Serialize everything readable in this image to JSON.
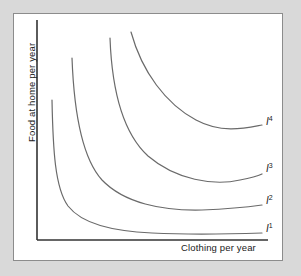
{
  "figure": {
    "background_color": "#d9d9d9",
    "panel_color": "#ffffff",
    "panel_border_color": "#8c8c8c",
    "axis_color": "#333333",
    "curve_color": "#6a6a6a"
  },
  "chart_data": {
    "type": "line",
    "title": "",
    "subtitle": "",
    "xlabel": "Clothing per year",
    "ylabel": "Food at home per year",
    "grid": false,
    "legend_position": "inline-right-endpoint",
    "xlim": [
      0,
      1
    ],
    "ylim": [
      0,
      1
    ],
    "axis_ticks": {
      "x": [],
      "y": []
    },
    "annotations": [
      {
        "text": "I",
        "superscript": "1",
        "at_curve": "I1"
      },
      {
        "text": "I",
        "superscript": "2",
        "at_curve": "I2"
      },
      {
        "text": "I",
        "superscript": "3",
        "at_curve": "I3"
      },
      {
        "text": "I",
        "superscript": "4",
        "at_curve": "I4"
      }
    ],
    "series": [
      {
        "name": "I1",
        "label": "I",
        "superscript": "1",
        "utility_level": 1,
        "label_x": 266,
        "label_y": 223,
        "path": "M 52,100 C 53,150 55,188 68,206 C 82,224 112,231 152,233 C 192,235 232,234 262,233"
      },
      {
        "name": "I2",
        "label": "I",
        "superscript": "2",
        "utility_level": 2,
        "label_x": 266,
        "label_y": 195,
        "path": "M 72,58 C 74,112 82,158 102,180 C 124,203 162,211 202,210 C 228,209 248,207 262,205"
      },
      {
        "name": "I3",
        "label": "I",
        "superscript": "3",
        "utility_level": 3,
        "label_x": 266,
        "label_y": 163,
        "path": "M 110,38 C 112,92 124,134 148,156 C 176,180 214,186 240,180 C 251,178 258,176 262,174"
      },
      {
        "name": "I4",
        "label": "I",
        "superscript": "4",
        "utility_level": 4,
        "label_x": 266,
        "label_y": 116,
        "path": "M 131,32 C 142,72 166,104 196,120 C 222,134 246,128 262,125"
      }
    ],
    "axes_geometry": {
      "origin_x": 37,
      "origin_y": 240,
      "y_axis_top": 20,
      "x_axis_right": 268
    }
  }
}
